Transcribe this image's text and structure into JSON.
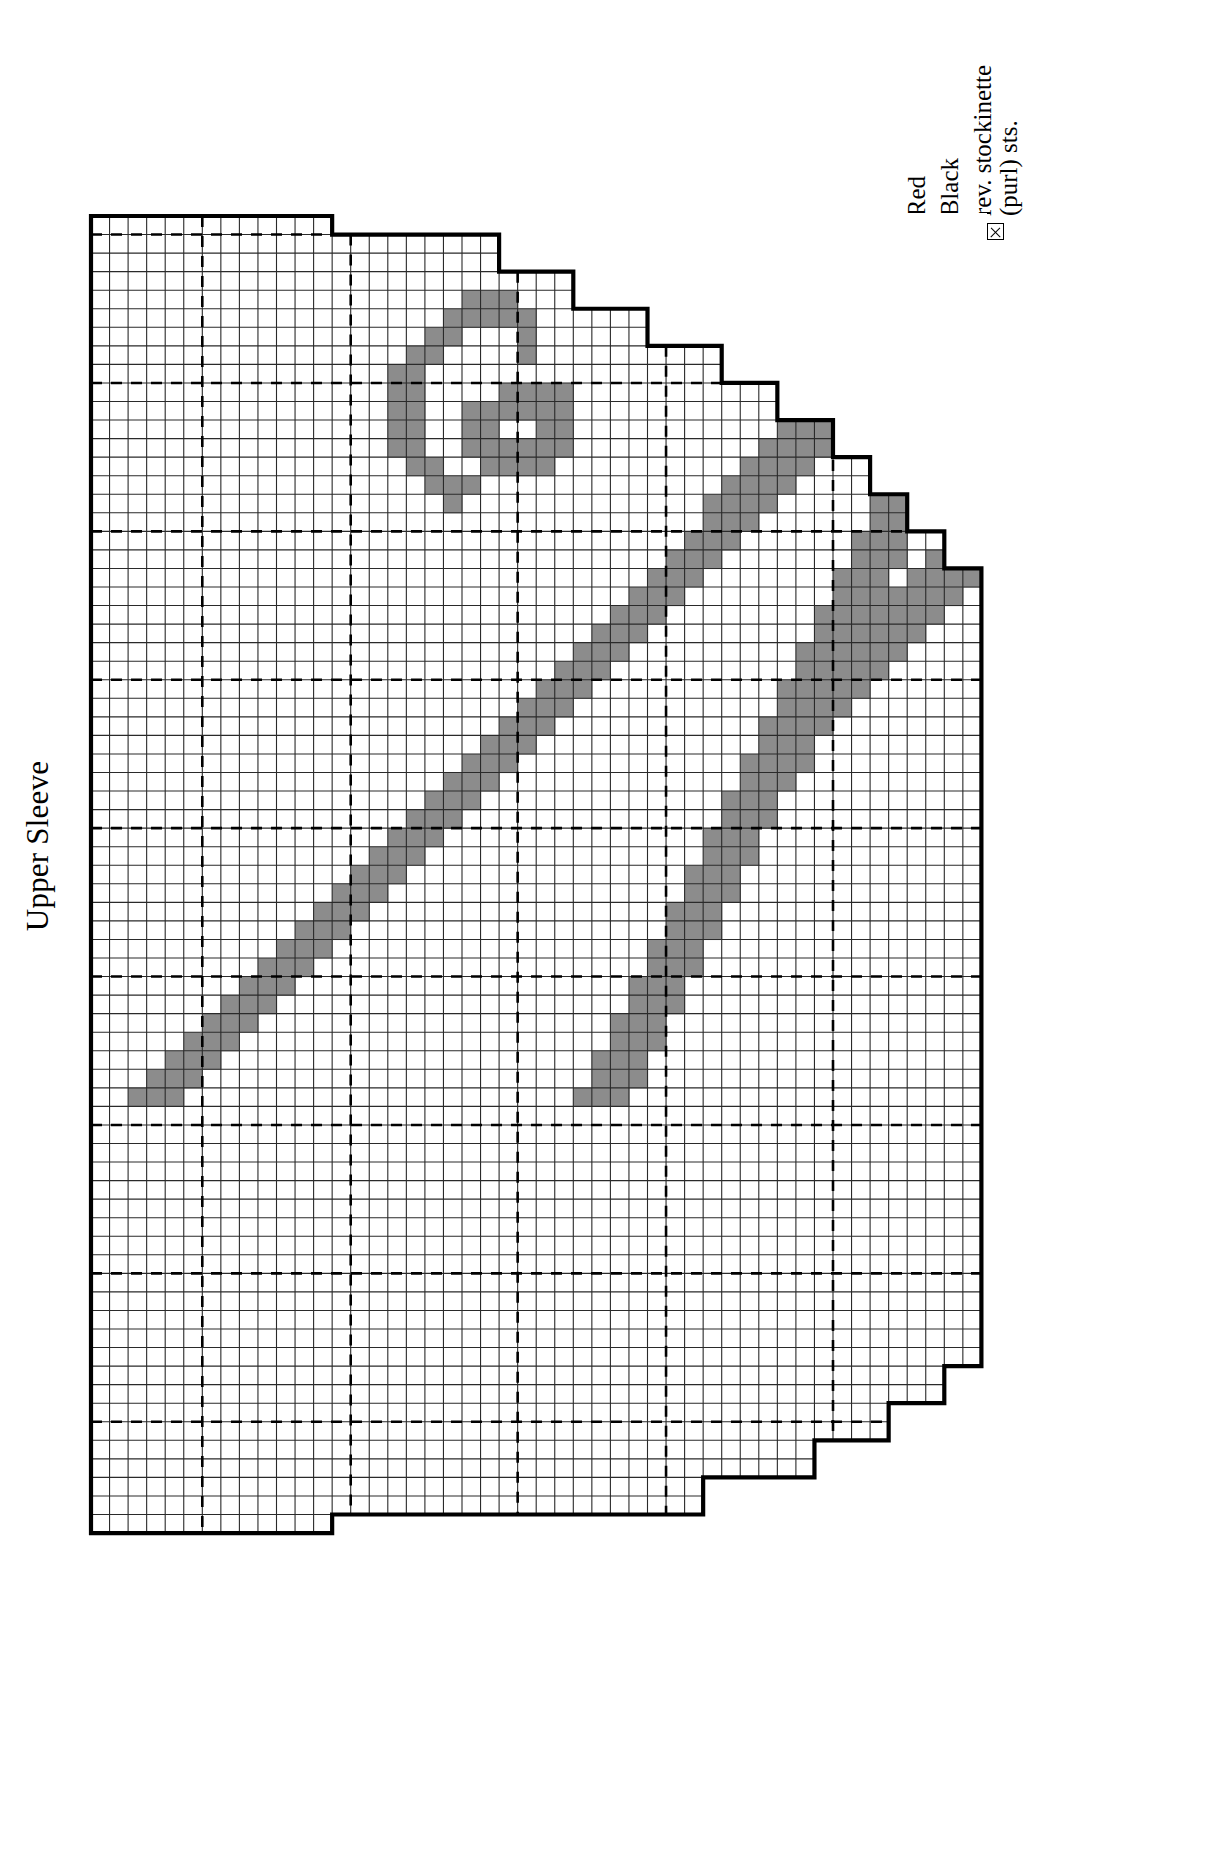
{
  "page": {
    "title": "Upper Sleeve",
    "background": "#ffffff"
  },
  "legend": {
    "title": "",
    "items": [
      {
        "label": "Red",
        "swatch": "white-square",
        "color": "#ffffff",
        "icon": "empty-square-icon"
      },
      {
        "label": "Black",
        "swatch": "gray-square",
        "color": "#8c8c8c",
        "icon": "filled-square-icon"
      },
      {
        "label": "rev. stockinette\n(purl) sts.",
        "swatch": "x-box",
        "color": "#ffffff",
        "icon": "x-box-icon"
      }
    ]
  },
  "chart_data": {
    "type": "heatmap",
    "title": "Upper Sleeve",
    "xlabel": "",
    "ylabel": "",
    "cell_px": 18.55,
    "cols": 48,
    "rows": 71,
    "grid": true,
    "grid_color": "#000000",
    "fill_color": "#8c8c8c",
    "empty_color": "#ffffff",
    "outline_color": "#000000",
    "guide_line_style": "dashed",
    "guide_cols": [
      6,
      14,
      23,
      31,
      40
    ],
    "guide_rows": [
      1,
      9,
      17,
      25,
      33,
      41,
      49,
      57,
      65
    ],
    "row_extents": [
      [
        0,
        13
      ],
      [
        0,
        22
      ],
      [
        0,
        22
      ],
      [
        0,
        26
      ],
      [
        0,
        26
      ],
      [
        0,
        30
      ],
      [
        0,
        30
      ],
      [
        0,
        34
      ],
      [
        0,
        34
      ],
      [
        0,
        37
      ],
      [
        0,
        37
      ],
      [
        0,
        40
      ],
      [
        0,
        40
      ],
      [
        0,
        42
      ],
      [
        0,
        42
      ],
      [
        0,
        44
      ],
      [
        0,
        44
      ],
      [
        0,
        46
      ],
      [
        0,
        46
      ],
      [
        0,
        48
      ],
      [
        0,
        48
      ],
      [
        0,
        48
      ],
      [
        0,
        48
      ],
      [
        0,
        48
      ],
      [
        0,
        48
      ],
      [
        0,
        48
      ],
      [
        0,
        48
      ],
      [
        0,
        48
      ],
      [
        0,
        48
      ],
      [
        0,
        48
      ],
      [
        0,
        48
      ],
      [
        0,
        48
      ],
      [
        0,
        48
      ],
      [
        0,
        48
      ],
      [
        0,
        48
      ],
      [
        0,
        48
      ],
      [
        0,
        48
      ],
      [
        0,
        48
      ],
      [
        0,
        48
      ],
      [
        0,
        48
      ],
      [
        0,
        48
      ],
      [
        0,
        48
      ],
      [
        0,
        48
      ],
      [
        0,
        48
      ],
      [
        0,
        48
      ],
      [
        0,
        48
      ],
      [
        0,
        48
      ],
      [
        0,
        48
      ],
      [
        0,
        48
      ],
      [
        0,
        48
      ],
      [
        0,
        48
      ],
      [
        0,
        48
      ],
      [
        0,
        48
      ],
      [
        0,
        48
      ],
      [
        0,
        48
      ],
      [
        0,
        48
      ],
      [
        0,
        48
      ],
      [
        0,
        48
      ],
      [
        0,
        48
      ],
      [
        0,
        48
      ],
      [
        0,
        48
      ],
      [
        0,
        48
      ],
      [
        0,
        46
      ],
      [
        0,
        46
      ],
      [
        0,
        43
      ],
      [
        0,
        43
      ],
      [
        0,
        39
      ],
      [
        0,
        39
      ],
      [
        0,
        33
      ],
      [
        0,
        33
      ],
      [
        0,
        13
      ]
    ],
    "filled_cells": [
      [
        4,
        20
      ],
      [
        4,
        21
      ],
      [
        4,
        22
      ],
      [
        5,
        19
      ],
      [
        5,
        20
      ],
      [
        5,
        21
      ],
      [
        5,
        22
      ],
      [
        5,
        23
      ],
      [
        6,
        18
      ],
      [
        6,
        19
      ],
      [
        6,
        23
      ],
      [
        7,
        17
      ],
      [
        7,
        18
      ],
      [
        7,
        23
      ],
      [
        8,
        16
      ],
      [
        8,
        17
      ],
      [
        9,
        16
      ],
      [
        9,
        17
      ],
      [
        9,
        22
      ],
      [
        9,
        23
      ],
      [
        9,
        24
      ],
      [
        9,
        25
      ],
      [
        10,
        16
      ],
      [
        10,
        17
      ],
      [
        10,
        20
      ],
      [
        10,
        21
      ],
      [
        10,
        22
      ],
      [
        10,
        23
      ],
      [
        10,
        24
      ],
      [
        10,
        25
      ],
      [
        11,
        16
      ],
      [
        11,
        17
      ],
      [
        11,
        20
      ],
      [
        11,
        21
      ],
      [
        11,
        24
      ],
      [
        11,
        25
      ],
      [
        12,
        16
      ],
      [
        12,
        17
      ],
      [
        12,
        20
      ],
      [
        12,
        21
      ],
      [
        12,
        22
      ],
      [
        12,
        23
      ],
      [
        12,
        24
      ],
      [
        12,
        25
      ],
      [
        13,
        17
      ],
      [
        13,
        18
      ],
      [
        13,
        21
      ],
      [
        13,
        22
      ],
      [
        13,
        23
      ],
      [
        13,
        24
      ],
      [
        14,
        18
      ],
      [
        14,
        19
      ],
      [
        14,
        20
      ],
      [
        15,
        19
      ],
      [
        4,
        44
      ],
      [
        4,
        45
      ],
      [
        4,
        46
      ],
      [
        4,
        47
      ],
      [
        5,
        43
      ],
      [
        5,
        44
      ],
      [
        5,
        45
      ],
      [
        5,
        46
      ],
      [
        5,
        47
      ],
      [
        6,
        42
      ],
      [
        6,
        43
      ],
      [
        6,
        44
      ],
      [
        6,
        45
      ],
      [
        6,
        46
      ],
      [
        6,
        47
      ],
      [
        7,
        41
      ],
      [
        7,
        42
      ],
      [
        7,
        43
      ],
      [
        7,
        44
      ],
      [
        7,
        46
      ],
      [
        7,
        47
      ],
      [
        8,
        40
      ],
      [
        8,
        41
      ],
      [
        8,
        42
      ],
      [
        8,
        43
      ],
      [
        8,
        46
      ],
      [
        8,
        47
      ],
      [
        9,
        39
      ],
      [
        9,
        40
      ],
      [
        9,
        41
      ],
      [
        9,
        42
      ],
      [
        9,
        45
      ],
      [
        9,
        46
      ],
      [
        9,
        47
      ],
      [
        10,
        38
      ],
      [
        10,
        39
      ],
      [
        10,
        40
      ],
      [
        10,
        41
      ],
      [
        10,
        45
      ],
      [
        10,
        46
      ],
      [
        10,
        47
      ],
      [
        11,
        37
      ],
      [
        11,
        38
      ],
      [
        11,
        39
      ],
      [
        11,
        40
      ],
      [
        11,
        44
      ],
      [
        11,
        45
      ],
      [
        11,
        46
      ],
      [
        12,
        36
      ],
      [
        12,
        37
      ],
      [
        12,
        38
      ],
      [
        12,
        39
      ],
      [
        12,
        44
      ],
      [
        12,
        45
      ],
      [
        12,
        46
      ],
      [
        13,
        35
      ],
      [
        13,
        36
      ],
      [
        13,
        37
      ],
      [
        13,
        38
      ],
      [
        13,
        43
      ],
      [
        13,
        44
      ],
      [
        13,
        45
      ],
      [
        14,
        34
      ],
      [
        14,
        35
      ],
      [
        14,
        36
      ],
      [
        14,
        37
      ],
      [
        14,
        43
      ],
      [
        14,
        44
      ],
      [
        14,
        45
      ],
      [
        15,
        33
      ],
      [
        15,
        34
      ],
      [
        15,
        35
      ],
      [
        15,
        36
      ],
      [
        15,
        42
      ],
      [
        15,
        43
      ],
      [
        15,
        44
      ],
      [
        16,
        33
      ],
      [
        16,
        34
      ],
      [
        16,
        35
      ],
      [
        16,
        42
      ],
      [
        16,
        43
      ],
      [
        16,
        44
      ],
      [
        17,
        32
      ],
      [
        17,
        33
      ],
      [
        17,
        34
      ],
      [
        17,
        41
      ],
      [
        17,
        42
      ],
      [
        17,
        43
      ],
      [
        17,
        46
      ],
      [
        17,
        47
      ],
      [
        18,
        31
      ],
      [
        18,
        32
      ],
      [
        18,
        33
      ],
      [
        18,
        41
      ],
      [
        18,
        42
      ],
      [
        18,
        43
      ],
      [
        18,
        45
      ],
      [
        18,
        46
      ],
      [
        18,
        47
      ],
      [
        19,
        30
      ],
      [
        19,
        31
      ],
      [
        19,
        32
      ],
      [
        19,
        40
      ],
      [
        19,
        41
      ],
      [
        19,
        42
      ],
      [
        19,
        44
      ],
      [
        19,
        45
      ],
      [
        19,
        46
      ],
      [
        19,
        47
      ],
      [
        20,
        29
      ],
      [
        20,
        30
      ],
      [
        20,
        31
      ],
      [
        20,
        40
      ],
      [
        20,
        41
      ],
      [
        20,
        42
      ],
      [
        20,
        43
      ],
      [
        20,
        44
      ],
      [
        20,
        45
      ],
      [
        20,
        46
      ],
      [
        21,
        28
      ],
      [
        21,
        29
      ],
      [
        21,
        30
      ],
      [
        21,
        39
      ],
      [
        21,
        40
      ],
      [
        21,
        41
      ],
      [
        21,
        42
      ],
      [
        21,
        43
      ],
      [
        21,
        44
      ],
      [
        21,
        45
      ],
      [
        22,
        27
      ],
      [
        22,
        28
      ],
      [
        22,
        29
      ],
      [
        22,
        39
      ],
      [
        22,
        40
      ],
      [
        22,
        41
      ],
      [
        22,
        42
      ],
      [
        22,
        43
      ],
      [
        22,
        44
      ],
      [
        23,
        26
      ],
      [
        23,
        27
      ],
      [
        23,
        28
      ],
      [
        23,
        38
      ],
      [
        23,
        39
      ],
      [
        23,
        40
      ],
      [
        23,
        41
      ],
      [
        23,
        42
      ],
      [
        23,
        43
      ],
      [
        24,
        25
      ],
      [
        24,
        26
      ],
      [
        24,
        27
      ],
      [
        24,
        38
      ],
      [
        24,
        39
      ],
      [
        24,
        40
      ],
      [
        24,
        41
      ],
      [
        24,
        42
      ],
      [
        25,
        24
      ],
      [
        25,
        25
      ],
      [
        25,
        26
      ],
      [
        25,
        37
      ],
      [
        25,
        38
      ],
      [
        25,
        39
      ],
      [
        25,
        40
      ],
      [
        25,
        41
      ],
      [
        26,
        23
      ],
      [
        26,
        24
      ],
      [
        26,
        25
      ],
      [
        26,
        37
      ],
      [
        26,
        38
      ],
      [
        26,
        39
      ],
      [
        26,
        40
      ],
      [
        27,
        22
      ],
      [
        27,
        23
      ],
      [
        27,
        24
      ],
      [
        27,
        36
      ],
      [
        27,
        37
      ],
      [
        27,
        38
      ],
      [
        27,
        39
      ],
      [
        28,
        21
      ],
      [
        28,
        22
      ],
      [
        28,
        23
      ],
      [
        28,
        36
      ],
      [
        28,
        37
      ],
      [
        28,
        38
      ],
      [
        29,
        20
      ],
      [
        29,
        21
      ],
      [
        29,
        22
      ],
      [
        29,
        35
      ],
      [
        29,
        36
      ],
      [
        29,
        37
      ],
      [
        29,
        38
      ],
      [
        30,
        19
      ],
      [
        30,
        20
      ],
      [
        30,
        21
      ],
      [
        30,
        35
      ],
      [
        30,
        36
      ],
      [
        30,
        37
      ],
      [
        31,
        18
      ],
      [
        31,
        19
      ],
      [
        31,
        20
      ],
      [
        31,
        34
      ],
      [
        31,
        35
      ],
      [
        31,
        36
      ],
      [
        32,
        17
      ],
      [
        32,
        18
      ],
      [
        32,
        19
      ],
      [
        32,
        34
      ],
      [
        32,
        35
      ],
      [
        32,
        36
      ],
      [
        33,
        16
      ],
      [
        33,
        17
      ],
      [
        33,
        18
      ],
      [
        33,
        33
      ],
      [
        33,
        34
      ],
      [
        33,
        35
      ],
      [
        34,
        15
      ],
      [
        34,
        16
      ],
      [
        34,
        17
      ],
      [
        34,
        33
      ],
      [
        34,
        34
      ],
      [
        34,
        35
      ],
      [
        35,
        14
      ],
      [
        35,
        15
      ],
      [
        35,
        16
      ],
      [
        35,
        32
      ],
      [
        35,
        33
      ],
      [
        35,
        34
      ],
      [
        36,
        13
      ],
      [
        36,
        14
      ],
      [
        36,
        15
      ],
      [
        36,
        32
      ],
      [
        36,
        33
      ],
      [
        36,
        34
      ],
      [
        37,
        12
      ],
      [
        37,
        13
      ],
      [
        37,
        14
      ],
      [
        37,
        31
      ],
      [
        37,
        32
      ],
      [
        37,
        33
      ],
      [
        38,
        11
      ],
      [
        38,
        12
      ],
      [
        38,
        13
      ],
      [
        38,
        31
      ],
      [
        38,
        32
      ],
      [
        38,
        33
      ],
      [
        39,
        10
      ],
      [
        39,
        11
      ],
      [
        39,
        12
      ],
      [
        39,
        30
      ],
      [
        39,
        31
      ],
      [
        39,
        32
      ],
      [
        40,
        9
      ],
      [
        40,
        10
      ],
      [
        40,
        11
      ],
      [
        40,
        30
      ],
      [
        40,
        31
      ],
      [
        40,
        32
      ],
      [
        41,
        8
      ],
      [
        41,
        9
      ],
      [
        41,
        10
      ],
      [
        41,
        29
      ],
      [
        41,
        30
      ],
      [
        41,
        31
      ],
      [
        42,
        7
      ],
      [
        42,
        8
      ],
      [
        42,
        9
      ],
      [
        42,
        29
      ],
      [
        42,
        30
      ],
      [
        42,
        31
      ],
      [
        43,
        6
      ],
      [
        43,
        7
      ],
      [
        43,
        8
      ],
      [
        43,
        28
      ],
      [
        43,
        29
      ],
      [
        43,
        30
      ],
      [
        44,
        5
      ],
      [
        44,
        6
      ],
      [
        44,
        7
      ],
      [
        44,
        28
      ],
      [
        44,
        29
      ],
      [
        44,
        30
      ],
      [
        45,
        4
      ],
      [
        45,
        5
      ],
      [
        45,
        6
      ],
      [
        45,
        27
      ],
      [
        45,
        28
      ],
      [
        45,
        29
      ],
      [
        46,
        3
      ],
      [
        46,
        4
      ],
      [
        46,
        5
      ],
      [
        46,
        27
      ],
      [
        46,
        28
      ],
      [
        46,
        29
      ],
      [
        47,
        2
      ],
      [
        47,
        3
      ],
      [
        47,
        4
      ],
      [
        47,
        26
      ],
      [
        47,
        27
      ],
      [
        47,
        28
      ]
    ]
  }
}
